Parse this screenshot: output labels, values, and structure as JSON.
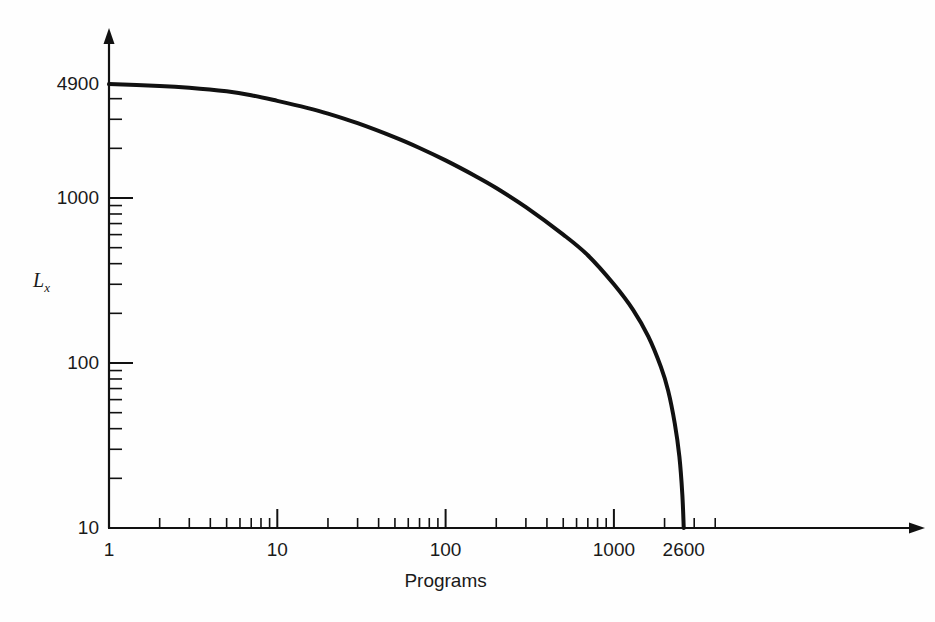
{
  "chart_data": {
    "type": "line",
    "title": "",
    "subtitle": "",
    "xlabel": "Programs",
    "ylabel": "L_x",
    "ylabel_base": "L",
    "ylabel_sub": "x",
    "xscale": "log",
    "yscale": "log",
    "xlim": [
      1,
      5000
    ],
    "ylim": [
      10,
      4900
    ],
    "grid": false,
    "legend": null,
    "x_ticks": [
      {
        "value": 1,
        "label": "1",
        "major": true
      },
      {
        "value": 10,
        "label": "10",
        "major": true
      },
      {
        "value": 100,
        "label": "100",
        "major": true
      },
      {
        "value": 1000,
        "label": "1000",
        "major": true
      },
      {
        "value": 2600,
        "label": "2600",
        "major": false
      }
    ],
    "y_ticks": [
      {
        "value": 10,
        "label": "10",
        "major": true
      },
      {
        "value": 100,
        "label": "100",
        "major": true
      },
      {
        "value": 1000,
        "label": "1000",
        "major": true
      },
      {
        "value": 4900,
        "label": "4900",
        "major": true
      }
    ],
    "x_minor_ticks": [
      2,
      3,
      4,
      5,
      6,
      7,
      8,
      9,
      20,
      30,
      40,
      50,
      60,
      70,
      80,
      90,
      200,
      300,
      400,
      500,
      600,
      700,
      800,
      900,
      2000,
      3000,
      4000
    ],
    "y_minor_ticks": [
      20,
      30,
      40,
      50,
      60,
      70,
      80,
      90,
      200,
      300,
      400,
      500,
      600,
      700,
      800,
      900,
      2000,
      3000,
      4000
    ],
    "series": [
      {
        "name": "Lx vs Programs",
        "color": "#111111",
        "line_width": 4,
        "x": [
          1,
          2,
          3,
          5,
          7,
          10,
          15,
          20,
          30,
          50,
          70,
          100,
          150,
          200,
          300,
          500,
          700,
          1000,
          1300,
          1600,
          1900,
          2100,
          2300,
          2450,
          2550,
          2600
        ],
        "y": [
          4900,
          4780,
          4660,
          4430,
          4200,
          3880,
          3520,
          3250,
          2840,
          2330,
          2010,
          1690,
          1360,
          1150,
          880,
          600,
          450,
          300,
          210,
          145,
          95,
          68,
          43,
          27,
          16,
          10
        ]
      }
    ],
    "annotations": []
  },
  "axis": {
    "x_arrow": true,
    "y_arrow": true,
    "line_color": "#111111",
    "line_width": 2.2
  },
  "colors": {
    "background": "#fefefe",
    "curve": "#111111",
    "axis": "#111111",
    "text": "#1a1a1a"
  }
}
